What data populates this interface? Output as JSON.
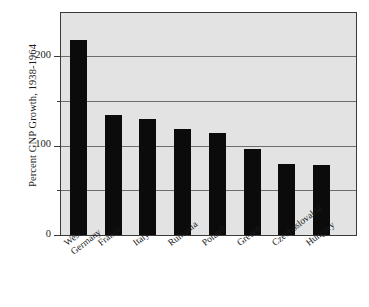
{
  "chart_data": {
    "type": "bar",
    "title": "",
    "xlabel": "",
    "ylabel": "Percent GNP Growth, 1938-1964",
    "categories": [
      "West\nGermany",
      "France",
      "Italy",
      "Rumania",
      "Poland",
      "Greece",
      "Czechoslovakia",
      "Hungary"
    ],
    "values": [
      218,
      134,
      130,
      118,
      114,
      96,
      79,
      78
    ],
    "ylim": [
      0,
      248
    ],
    "yticks": [
      0,
      100,
      200
    ],
    "ytick_labels": [
      "0",
      "100",
      "200"
    ],
    "yminor_ticks": [
      50,
      150
    ],
    "grid": "horizontal",
    "gridlines": [
      50,
      100,
      150,
      200
    ],
    "legend": "none",
    "bar_color": "#0b0b0b",
    "plot_background": "#e3e3e3",
    "figure_background": "#ffffff",
    "frame_color": "#3a3a3a"
  }
}
